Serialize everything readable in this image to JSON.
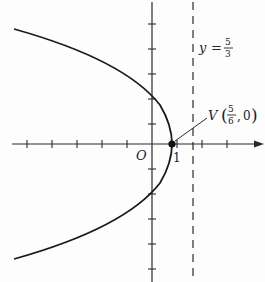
{
  "figure": {
    "type": "parabola-graph",
    "equation_note": "Parabola opening left with vertex V and dashed directrix",
    "axes": {
      "origin_label": "O",
      "x_tick_label": "1",
      "x_ticks_unit_px": 25,
      "y_ticks_unit_px": 25
    },
    "vertex": {
      "label_letter": "V",
      "label_num": "5",
      "label_den": "6",
      "label_y": "0"
    },
    "directrix": {
      "label_var": "y",
      "label_eq": "=",
      "label_num": "5",
      "label_den": "3",
      "style": "dashed"
    },
    "colors": {
      "curve": "#1a1a1a",
      "axes": "#2a2a2a",
      "background": "#fdfdfd"
    }
  }
}
